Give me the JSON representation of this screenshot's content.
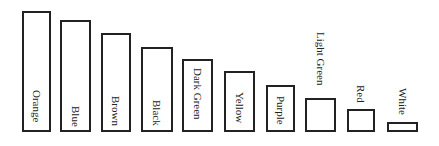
{
  "chart_data": {
    "type": "bar",
    "title": "",
    "xlabel": "",
    "ylabel": "",
    "grid": false,
    "legend": null,
    "orientation": "vertical",
    "baseline_y": 132,
    "categories": [
      "Orange",
      "Blue",
      "Brown",
      "Black",
      "Dark Green",
      "Yellow",
      "Purple",
      "Light Green",
      "Red",
      "White"
    ],
    "values": [
      121,
      112,
      99,
      85,
      73,
      61,
      47,
      34,
      23,
      10
    ],
    "value_units": "relative bar height (px)",
    "bars": [
      {
        "label": "Orange",
        "x": 22,
        "width": 29,
        "top": 11,
        "label_inside": true,
        "label_top": 90
      },
      {
        "label": "Blue",
        "x": 60,
        "width": 31,
        "top": 20,
        "label_inside": true,
        "label_top": 106
      },
      {
        "label": "Brown",
        "x": 101,
        "width": 30,
        "top": 33,
        "label_inside": true,
        "label_top": 96
      },
      {
        "label": "Black",
        "x": 141,
        "width": 32,
        "top": 47,
        "label_inside": true,
        "label_top": 100
      },
      {
        "label": "Dark Green",
        "x": 182,
        "width": 31,
        "top": 59,
        "label_inside": true,
        "label_top": 68
      },
      {
        "label": "Yellow",
        "x": 224,
        "width": 31,
        "top": 71,
        "label_inside": true,
        "label_top": 92
      },
      {
        "label": "Purple",
        "x": 266,
        "width": 29,
        "top": 85,
        "label_inside": true,
        "label_top": 96
      },
      {
        "label": "Light Green",
        "x": 305,
        "width": 31,
        "top": 98,
        "label_inside": false,
        "label_top": 32
      },
      {
        "label": "Red",
        "x": 347,
        "width": 28,
        "top": 109,
        "label_inside": false,
        "label_top": 85
      },
      {
        "label": "White",
        "x": 387,
        "width": 31,
        "top": 122,
        "label_inside": false,
        "label_top": 88
      }
    ]
  }
}
